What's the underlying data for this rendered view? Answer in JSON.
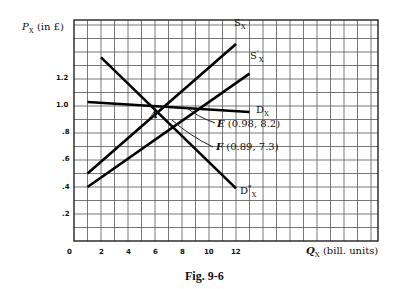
{
  "chart_data": {
    "type": "line",
    "title": "Fig. 9-6",
    "xlabel": "Q_X (bill. units)",
    "ylabel": "P_X (in £)",
    "xlim": [
      0,
      22.5
    ],
    "ylim": [
      0,
      1.64
    ],
    "grid": true,
    "x_ticks": [
      "0",
      "2",
      "4",
      "6",
      "8",
      "10",
      "12"
    ],
    "y_ticks": [
      ".2",
      ".4",
      ".6",
      ".8",
      "1.0",
      "1.2"
    ],
    "series": [
      {
        "name": "S_X",
        "points": [
          [
            1,
            0.5
          ],
          [
            12,
            1.46
          ]
        ]
      },
      {
        "name": "S'_X",
        "points": [
          [
            1,
            0.4
          ],
          [
            13,
            1.24
          ]
        ]
      },
      {
        "name": "D_X",
        "points": [
          [
            1,
            1.03
          ],
          [
            13,
            0.955
          ]
        ]
      },
      {
        "name": "D*_X",
        "points": [
          [
            2,
            1.36
          ],
          [
            12,
            0.39
          ]
        ]
      }
    ],
    "annotations": [
      {
        "label": "A",
        "x": 6,
        "y": 1.0
      },
      {
        "label": "E (0.98, 8.2)",
        "x": 8.2,
        "y": 0.98
      },
      {
        "label": "F (0.89, 7.3)",
        "x": 7.3,
        "y": 0.89
      }
    ]
  },
  "labels": {
    "ylabel": "P",
    "ylabel_sub": "X",
    "ylabel_rest": " (in £)",
    "xlabel": "Q",
    "xlabel_sub": "X",
    "xlabel_rest": " (bill. units)",
    "sx": "S",
    "sx_sub": "X",
    "sxp": "S",
    "sxp_sup": "'",
    "sxp_sub": "X",
    "dx": "D",
    "dx_sub": "X",
    "dstar": "D",
    "dstar_sup": "*",
    "dstar_sub": "X",
    "a": "A",
    "e": "E",
    "e_rest": " (0.98, 8.2)",
    "f": "F",
    "f_rest": " (0.89, 7.3)",
    "caption": "Fig. 9-6",
    "x0": "0",
    "x2": "2",
    "x4": "4",
    "x6": "6",
    "x8": "8",
    "x10": "10",
    "x12": "12",
    "y2": ".2",
    "y4": ".4",
    "y6": ".6",
    "y8": ".8",
    "y10": "1.0",
    "y12": "1.2"
  }
}
